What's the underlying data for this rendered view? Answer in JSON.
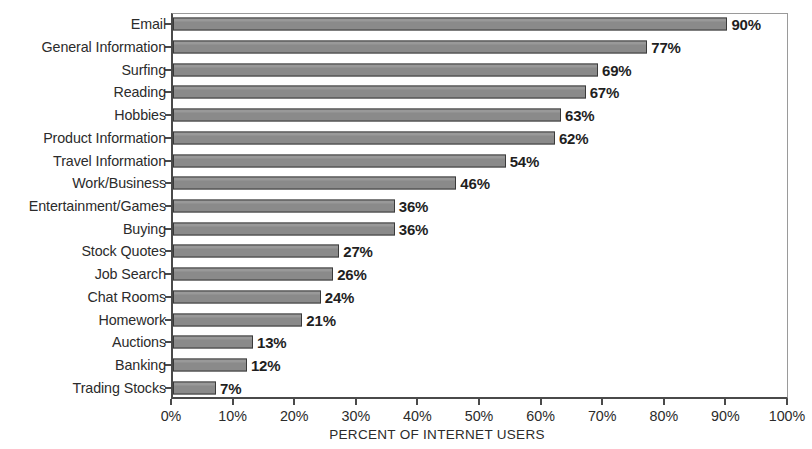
{
  "chart_data": {
    "type": "bar",
    "orientation": "horizontal",
    "title": "",
    "xlabel": "PERCENT OF INTERNET USERS",
    "ylabel": "",
    "xlim": [
      0,
      100
    ],
    "xticks": [
      "0%",
      "10%",
      "20%",
      "30%",
      "40%",
      "50%",
      "60%",
      "70%",
      "80%",
      "90%",
      "100%"
    ],
    "xtick_values": [
      0,
      10,
      20,
      30,
      40,
      50,
      60,
      70,
      80,
      90,
      100
    ],
    "grid": false,
    "legend": null,
    "bar_color": "#8a8a8a",
    "bar_border_color": "#3a3a3a",
    "axis_color": "#4a4a4a",
    "background": "#ffffff",
    "categories": [
      "Email",
      "General Information",
      "Surfing",
      "Reading",
      "Hobbies",
      "Product Information",
      "Travel Information",
      "Work/Business",
      "Entertainment/Games",
      "Buying",
      "Stock Quotes",
      "Job Search",
      "Chat Rooms",
      "Homework",
      "Auctions",
      "Banking",
      "Trading Stocks"
    ],
    "values": [
      90,
      77,
      69,
      67,
      63,
      62,
      54,
      46,
      36,
      36,
      27,
      26,
      24,
      21,
      13,
      12,
      7
    ],
    "data_labels": [
      "90%",
      "77%",
      "69%",
      "67%",
      "63%",
      "62%",
      "54%",
      "46%",
      "36%",
      "36%",
      "27%",
      "26%",
      "24%",
      "21%",
      "13%",
      "12%",
      "7%"
    ]
  }
}
